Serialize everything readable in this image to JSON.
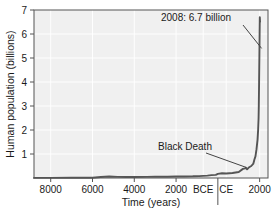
{
  "chart_data": {
    "type": "line",
    "title": "",
    "xlabel": "Time (years)",
    "ylabel": "Human population (billions)",
    "xlim": [
      -8800,
      2400
    ],
    "ylim": [
      0,
      7
    ],
    "grid": true,
    "legend": null,
    "xticks": [
      {
        "value": -8000,
        "label": "8000"
      },
      {
        "value": -6000,
        "label": "6000"
      },
      {
        "value": -4000,
        "label": "4000"
      },
      {
        "value": -2000,
        "label": "2000"
      },
      {
        "value": -700,
        "label": "BCE"
      },
      {
        "value": 400,
        "label": "CE"
      },
      {
        "value": 2000,
        "label": "2000"
      }
    ],
    "yticks": [
      {
        "value": 1,
        "label": "1"
      },
      {
        "value": 2,
        "label": "2"
      },
      {
        "value": 3,
        "label": "3"
      },
      {
        "value": 4,
        "label": "4"
      },
      {
        "value": 5,
        "label": "5"
      },
      {
        "value": 6,
        "label": "6"
      },
      {
        "value": 7,
        "label": "7"
      }
    ],
    "era_divider": {
      "value": 0,
      "label": "BCE/CE boundary"
    },
    "series": [
      {
        "name": "Human population",
        "color": "#555555",
        "x": [
          -8800,
          -8000,
          -7000,
          -6000,
          -5600,
          -5200,
          -4800,
          -4400,
          -4000,
          -3400,
          -3000,
          -2400,
          -2000,
          -1600,
          -1200,
          -900,
          -700,
          -500,
          -300,
          -100,
          0,
          200,
          400,
          700,
          1000,
          1200,
          1300,
          1340,
          1400,
          1500,
          1600,
          1700,
          1750,
          1800,
          1850,
          1900,
          1927,
          1950,
          1960,
          1974,
          1987,
          1999,
          2008,
          2020
        ],
        "y": [
          0.005,
          0.005,
          0.008,
          0.012,
          0.04,
          0.06,
          0.045,
          0.04,
          0.04,
          0.045,
          0.05,
          0.055,
          0.06,
          0.065,
          0.07,
          0.08,
          0.09,
          0.1,
          0.12,
          0.13,
          0.17,
          0.2,
          0.19,
          0.21,
          0.25,
          0.38,
          0.4,
          0.43,
          0.36,
          0.45,
          0.5,
          0.6,
          0.77,
          0.9,
          1.2,
          1.6,
          2.0,
          2.5,
          3.0,
          4.0,
          5.0,
          6.0,
          6.7,
          6.5
        ]
      }
    ],
    "annotations": [
      {
        "name": "peak-annotation",
        "text": "2008: 6.7 billion",
        "points_to": {
          "x": 2008,
          "y": 6.7
        }
      },
      {
        "name": "black-death-annotation",
        "text": "Black Death",
        "points_to": {
          "x": 1400,
          "y": 0.36
        }
      }
    ]
  },
  "style": {
    "plot_bg": "#f0f0f0",
    "grid_color": "#ffffff",
    "line_color": "#555555",
    "text_color": "#1a1a1a",
    "border_color": "#555555"
  }
}
